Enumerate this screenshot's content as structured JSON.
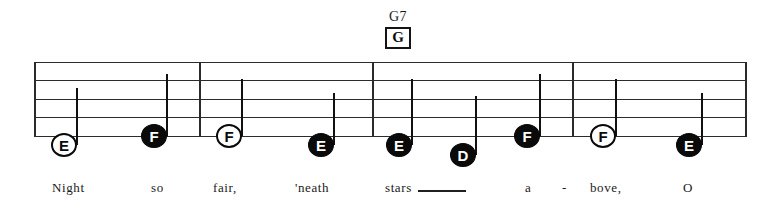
{
  "sheet": {
    "title_hidden": "",
    "staff": {
      "left": 34,
      "right": 746,
      "line_count": 5,
      "line_tops": [
        62,
        80,
        99,
        117,
        136
      ],
      "barlines": [
        199,
        372,
        572,
        745
      ]
    },
    "chord": {
      "name": "G7",
      "boxed_letter": "G",
      "x": 368,
      "name_y": 10,
      "box_y": 28
    },
    "notes": [
      {
        "letter": "E",
        "style": "hollow",
        "x": 51,
        "y": 133,
        "stem": "up",
        "stem_x": 76,
        "stem_top": 88,
        "stem_bottom": 145,
        "lyric": "Night"
      },
      {
        "letter": "F",
        "style": "filled",
        "x": 141,
        "y": 124,
        "stem": "up",
        "stem_x": 166,
        "stem_top": 74,
        "stem_bottom": 136,
        "lyric": "so"
      },
      {
        "letter": "F",
        "style": "hollow",
        "x": 216,
        "y": 124,
        "stem": "up",
        "stem_x": 241,
        "stem_top": 79,
        "stem_bottom": 136,
        "lyric": "fair,"
      },
      {
        "letter": "E",
        "style": "filled",
        "x": 308,
        "y": 133,
        "stem": "up",
        "stem_x": 333,
        "stem_top": 93,
        "stem_bottom": 145,
        "lyric": "'neath"
      },
      {
        "letter": "E",
        "style": "filled",
        "x": 386,
        "y": 133,
        "stem": "up",
        "stem_x": 411,
        "stem_top": 79,
        "stem_bottom": 145,
        "lyric": "stars"
      },
      {
        "letter": "D",
        "style": "filled",
        "x": 450,
        "y": 143,
        "stem": "up",
        "stem_x": 475,
        "stem_top": 96,
        "stem_bottom": 155,
        "lyric": ""
      },
      {
        "letter": "F",
        "style": "filled",
        "x": 514,
        "y": 124,
        "stem": "up",
        "stem_x": 539,
        "stem_top": 74,
        "stem_bottom": 136,
        "lyric": "a"
      },
      {
        "letter": "F",
        "style": "hollow",
        "x": 590,
        "y": 124,
        "stem": "up",
        "stem_x": 615,
        "stem_top": 79,
        "stem_bottom": 136,
        "lyric": "bove,"
      },
      {
        "letter": "E",
        "style": "filled",
        "x": 676,
        "y": 133,
        "stem": "up",
        "stem_x": 701,
        "stem_top": 93,
        "stem_bottom": 145,
        "lyric": "O"
      }
    ],
    "lyrics": [
      {
        "text": "Night",
        "x": 52,
        "y": 180
      },
      {
        "text": "so",
        "x": 151,
        "y": 180
      },
      {
        "text": "fair,",
        "x": 213,
        "y": 180
      },
      {
        "text": "'neath",
        "x": 295,
        "y": 180
      },
      {
        "text": "stars",
        "x": 385,
        "y": 180
      },
      {
        "text": "a",
        "x": 525,
        "y": 180
      },
      {
        "text": "-",
        "x": 562,
        "y": 180
      },
      {
        "text": "bove,",
        "x": 590,
        "y": 180
      },
      {
        "text": "O",
        "x": 683,
        "y": 180
      }
    ],
    "extender": {
      "x": 418,
      "y": 190,
      "width": 48
    }
  }
}
